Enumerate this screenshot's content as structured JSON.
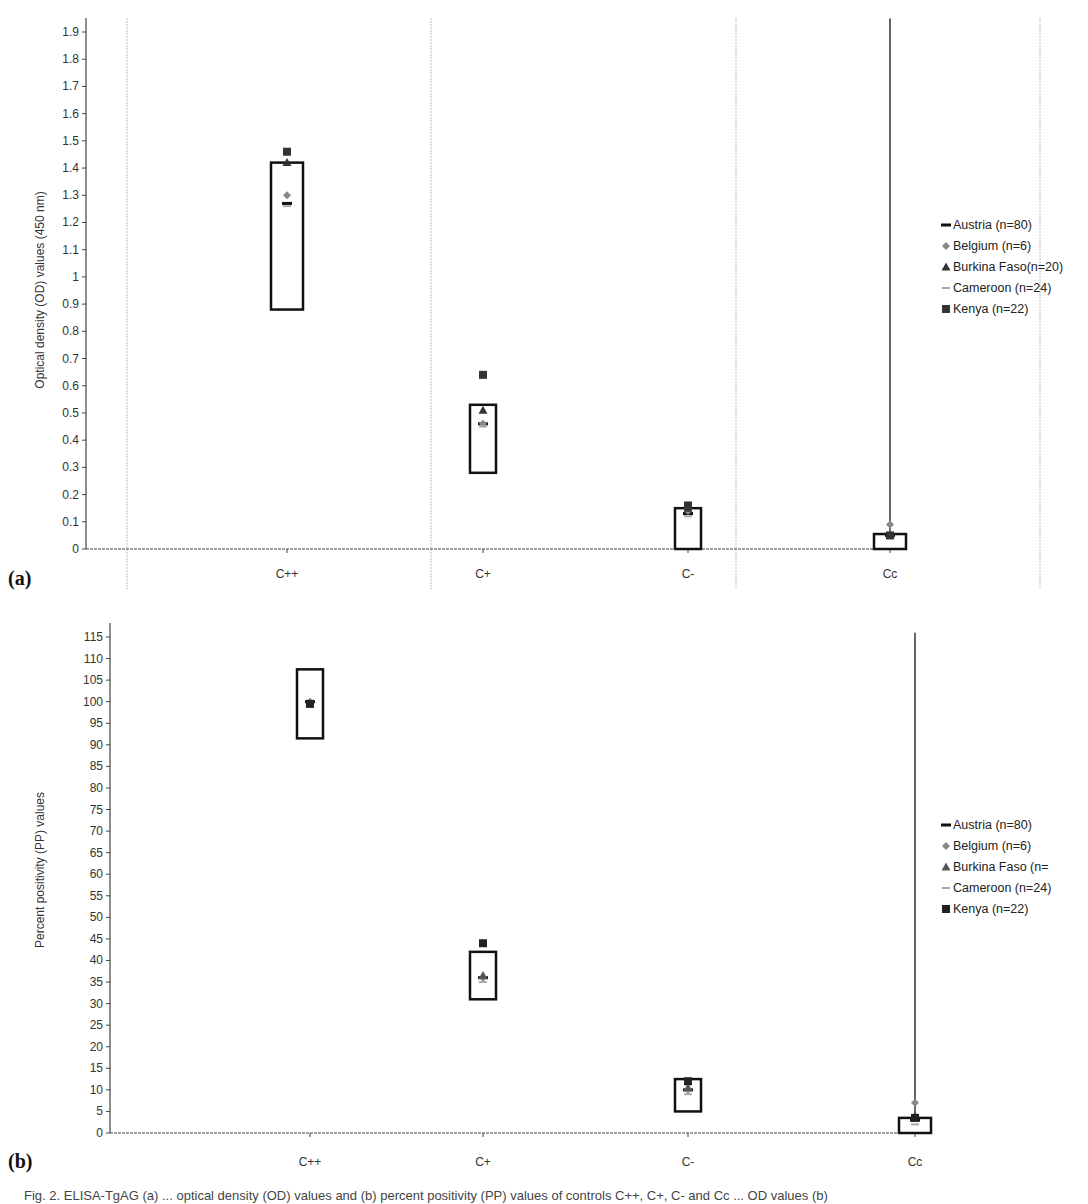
{
  "chart_data": [
    {
      "panel": "(a)",
      "type": "scatter",
      "title": "",
      "xlabel": "",
      "ylabel": "Optical density (OD) values (450 nm)",
      "ylim": [
        0,
        1.9
      ],
      "yticks": [
        "0",
        "0.1",
        "0.2",
        "0.3",
        "0.4",
        "0.5",
        "0.6",
        "0.7",
        "0.8",
        "0.9",
        "1",
        "1.1",
        "1.2",
        "1.3",
        "1.4",
        "1.5",
        "1.6",
        "1.7",
        "1.8",
        "1.9"
      ],
      "ytick_values": [
        0,
        0.1,
        0.2,
        0.3,
        0.4,
        0.5,
        0.6,
        0.7,
        0.8,
        0.9,
        1.0,
        1.1,
        1.2,
        1.3,
        1.4,
        1.5,
        1.6,
        1.7,
        1.8,
        1.9
      ],
      "categories": [
        "C++",
        "C+",
        "C-",
        "Cc"
      ],
      "grid": "vertical dashed separators between categories",
      "legend_position": "right",
      "ranges": [
        {
          "category": "C++",
          "low": 0.88,
          "high": 1.42
        },
        {
          "category": "C+",
          "low": 0.28,
          "high": 0.53
        },
        {
          "category": "C-",
          "low": 0.0,
          "high": 0.15
        },
        {
          "category": "Cc",
          "low": 0.0,
          "high": 0.055
        }
      ],
      "series": [
        {
          "name": "Austria (n=80)",
          "marker": "dash",
          "color": "#111111",
          "values": [
            1.27,
            0.46,
            0.13,
            0.05
          ]
        },
        {
          "name": "Belgium (n=6)",
          "marker": "diamond",
          "color": "#888888",
          "values": [
            1.3,
            0.46,
            0.14,
            0.09
          ]
        },
        {
          "name": "Burkina Faso(n=20)",
          "marker": "triangle",
          "color": "#333333",
          "values": [
            1.42,
            0.51,
            0.15,
            0.05
          ]
        },
        {
          "name": "Cameroon (n=24)",
          "marker": "dash-light",
          "color": "#aaaaaa",
          "values": [
            1.26,
            0.45,
            0.12,
            0.04
          ]
        },
        {
          "name": "Kenya (n=22)",
          "marker": "square",
          "color": "#333333",
          "values": [
            1.46,
            0.64,
            0.16,
            0.05
          ]
        }
      ],
      "vertical_line": {
        "category": "Cc",
        "from": 0.05,
        "to": 1.95
      }
    },
    {
      "panel": "(b)",
      "type": "scatter",
      "title": "",
      "xlabel": "",
      "ylabel": "Percent positivity (PP) values",
      "ylim": [
        0,
        115
      ],
      "yticks": [
        "0",
        "5",
        "10",
        "15",
        "20",
        "25",
        "30",
        "35",
        "40",
        "45",
        "50",
        "55",
        "60",
        "65",
        "70",
        "75",
        "80",
        "85",
        "90",
        "95",
        "100",
        "105",
        "110",
        "115"
      ],
      "ytick_values": [
        0,
        5,
        10,
        15,
        20,
        25,
        30,
        35,
        40,
        45,
        50,
        55,
        60,
        65,
        70,
        75,
        80,
        85,
        90,
        95,
        100,
        105,
        110,
        115
      ],
      "categories": [
        "C++",
        "C+",
        "C-",
        "Cc"
      ],
      "grid": "none",
      "legend_position": "right",
      "ranges": [
        {
          "category": "C++",
          "low": 91.5,
          "high": 107.5
        },
        {
          "category": "C+",
          "low": 31,
          "high": 42
        },
        {
          "category": "C-",
          "low": 5,
          "high": 12.5
        },
        {
          "category": "Cc",
          "low": 0,
          "high": 3.5
        }
      ],
      "series": [
        {
          "name": "Austria (n=80)",
          "marker": "dash",
          "color": "#111111",
          "values": [
            100,
            36,
            10,
            3
          ]
        },
        {
          "name": "Belgium (n=6)",
          "marker": "diamond",
          "color": "#888888",
          "values": [
            100,
            36,
            10,
            7
          ]
        },
        {
          "name": "Burkina Faso (n=",
          "marker": "triangle",
          "color": "#555555",
          "values": [
            99.5,
            36.5,
            10.5,
            4
          ]
        },
        {
          "name": "Cameroon (n=24)",
          "marker": "dash-light",
          "color": "#aaaaaa",
          "values": [
            99,
            35,
            9,
            2
          ]
        },
        {
          "name": "Kenya (n=22)",
          "marker": "square",
          "color": "#222222",
          "values": [
            99.5,
            44,
            12,
            3.5
          ]
        }
      ],
      "vertical_line": {
        "category": "Cc",
        "from": 4,
        "to": 116
      }
    }
  ],
  "caption": "Fig. 2. ELISA-TgAG (a) ... optical density (OD) values and (b) percent positivity (PP) values of controls C++, C+, C- and Cc ... OD values (b)"
}
